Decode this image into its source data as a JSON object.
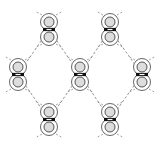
{
  "diagram": {
    "colors": {
      "background": "#ffffff",
      "outer_ring": "#555555",
      "inner_ring": "#444444",
      "inner_fill": "#dddddd",
      "bond": "#111111",
      "dash": "#777777"
    },
    "molecules": [
      {
        "id": "m1",
        "x": 49,
        "y_top": 22,
        "y_bottom": 37
      },
      {
        "id": "m2",
        "x": 110,
        "y_top": 22,
        "y_bottom": 37
      },
      {
        "id": "m3",
        "x": 18,
        "y_top": 67,
        "y_bottom": 82
      },
      {
        "id": "m4",
        "x": 80,
        "y_top": 67,
        "y_bottom": 82
      },
      {
        "id": "m5",
        "x": 142,
        "y_top": 67,
        "y_bottom": 82
      },
      {
        "id": "m6",
        "x": 49,
        "y_top": 112,
        "y_bottom": 127
      },
      {
        "id": "m7",
        "x": 110,
        "y_top": 112,
        "y_bottom": 127
      }
    ],
    "links": [
      [
        "m1",
        "m3"
      ],
      [
        "m1",
        "m4"
      ],
      [
        "m2",
        "m4"
      ],
      [
        "m2",
        "m5"
      ],
      [
        "m3",
        "m6"
      ],
      [
        "m4",
        "m6"
      ],
      [
        "m4",
        "m7"
      ],
      [
        "m5",
        "m7"
      ]
    ]
  }
}
